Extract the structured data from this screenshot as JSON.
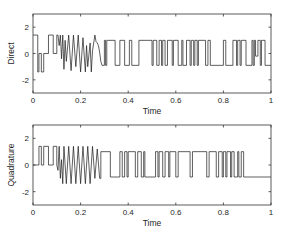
{
  "figure": {
    "width": 284,
    "height": 236,
    "line_color": "#1a1a1a",
    "axis_color": "#333333",
    "background": "#ffffff"
  },
  "chart_data": [
    {
      "type": "line",
      "id": "direct",
      "title": "",
      "xlabel": "Time",
      "ylabel": "Direct",
      "xlim": [
        0,
        1
      ],
      "ylim": [
        -3,
        3
      ],
      "xticks": [
        0,
        0.2,
        0.4,
        0.6,
        0.8,
        1
      ],
      "xtick_labels": [
        "0",
        "0.2",
        "0.4",
        "0.6",
        "0.8",
        "1"
      ],
      "yticks": [
        2,
        0,
        -2
      ],
      "ytick_labels": [
        "2",
        "0",
        "-2"
      ],
      "grid": false,
      "legend": null,
      "box": {
        "left": 33,
        "right": 271,
        "top": 14,
        "bottom": 93
      },
      "series": [
        {
          "name": "Direct",
          "x": [
            0,
            0.02,
            0.02,
            0.025,
            0.025,
            0.035,
            0.035,
            0.045,
            0.045,
            0.065,
            0.065,
            0.085,
            0.085,
            0.1,
            0.1,
            0.105,
            0.11,
            0.115,
            0.12,
            0.125,
            0.13,
            0.135,
            0.14,
            0.15,
            0.16,
            0.17,
            0.18,
            0.19,
            0.2,
            0.21,
            0.22,
            0.225,
            0.23,
            0.24,
            0.245,
            0.25,
            0.26,
            0.265,
            0.27,
            0.275,
            0.28,
            0.285,
            0.29,
            0.3,
            0.3,
            0.305,
            0.305,
            0.31,
            0.31,
            0.345,
            0.345,
            0.365,
            0.365,
            0.385,
            0.385,
            0.405,
            0.405,
            0.415,
            0.415,
            0.445,
            0.445,
            0.5,
            0.5,
            0.505,
            0.505,
            0.52,
            0.52,
            0.53,
            0.53,
            0.54,
            0.54,
            0.545,
            0.545,
            0.555,
            0.555,
            0.565,
            0.565,
            0.585,
            0.585,
            0.59,
            0.59,
            0.61,
            0.61,
            0.625,
            0.625,
            0.63,
            0.63,
            0.645,
            0.645,
            0.66,
            0.66,
            0.665,
            0.665,
            0.675,
            0.675,
            0.68,
            0.68,
            0.69,
            0.69,
            0.695,
            0.695,
            0.725,
            0.725,
            0.735,
            0.735,
            0.745,
            0.745,
            0.8,
            0.8,
            0.81,
            0.81,
            0.84,
            0.84,
            0.855,
            0.855,
            0.86,
            0.86,
            0.87,
            0.87,
            0.875,
            0.875,
            0.895,
            0.895,
            0.92,
            0.92,
            0.925,
            0.925,
            0.93,
            0.93,
            0.935,
            0.935,
            0.945,
            0.945,
            0.955,
            0.955,
            0.96,
            0.96,
            0.975,
            0.975,
            1
          ],
          "y": [
            1.4,
            1.4,
            -1.4,
            -1.4,
            0,
            0,
            -1.4,
            -1.4,
            0,
            0,
            1.4,
            1.4,
            0,
            0,
            1.4,
            1.4,
            0.6,
            1.4,
            -0.4,
            1.4,
            -1.2,
            1.0,
            -0.6,
            1.4,
            -1.3,
            1.4,
            -1.0,
            1.4,
            -1.4,
            1.2,
            -1.4,
            0.6,
            -1.0,
            0.8,
            -1.4,
            0.2,
            1.4,
            0.9,
            0.8,
            0.6,
            0.1,
            -0.6,
            -0.9,
            -0.9,
            1.0,
            1.0,
            -0.9,
            -0.9,
            1.0,
            1.0,
            -0.9,
            -0.9,
            1.0,
            1.0,
            -0.9,
            -0.9,
            1.0,
            1.0,
            -0.9,
            -0.9,
            1.0,
            1.0,
            -0.9,
            -0.9,
            1.0,
            1.0,
            -0.9,
            -0.9,
            1.0,
            1.0,
            -0.9,
            -0.9,
            1.0,
            1.0,
            -0.9,
            -0.9,
            1.0,
            1.0,
            -0.9,
            -0.9,
            1.0,
            1.0,
            -0.9,
            -0.9,
            1.0,
            1.0,
            -0.9,
            -0.9,
            1.0,
            1.0,
            -0.9,
            -0.9,
            1.0,
            1.0,
            -0.9,
            -0.9,
            1.0,
            1.0,
            -0.9,
            -0.9,
            1.0,
            1.0,
            -0.9,
            -0.9,
            1.0,
            1.0,
            -0.9,
            -0.9,
            1.0,
            1.0,
            -0.9,
            -0.9,
            1.0,
            1.0,
            -0.9,
            -0.9,
            1.0,
            1.0,
            -0.9,
            -0.9,
            1.0,
            1.0,
            -0.9,
            -0.9,
            1.0,
            1.0,
            -0.9,
            -0.9,
            1.0,
            1.0,
            -0.2,
            -0.2,
            1.0,
            1.0,
            -0.9,
            -0.9,
            1.0,
            1.0,
            -0.9,
            -0.9,
            -0.9
          ]
        }
      ]
    },
    {
      "type": "line",
      "id": "quadrature",
      "title": "",
      "xlabel": "Time",
      "ylabel": "Quadrature",
      "xlim": [
        0,
        1
      ],
      "ylim": [
        -3,
        3
      ],
      "xticks": [
        0,
        0.2,
        0.4,
        0.6,
        0.8,
        1
      ],
      "xtick_labels": [
        "0",
        "0.2",
        "0.4",
        "0.6",
        "0.8",
        "1"
      ],
      "yticks": [
        2,
        0,
        -2
      ],
      "ytick_labels": [
        "2",
        "0",
        "-2"
      ],
      "grid": false,
      "legend": null,
      "box": {
        "left": 33,
        "right": 271,
        "top": 125,
        "bottom": 205
      },
      "series": [
        {
          "name": "Quadrature",
          "x": [
            0,
            0.02,
            0.02,
            0.025,
            0.025,
            0.035,
            0.035,
            0.045,
            0.045,
            0.065,
            0.065,
            0.085,
            0.085,
            0.1,
            0.1,
            0.105,
            0.11,
            0.115,
            0.12,
            0.125,
            0.13,
            0.14,
            0.15,
            0.16,
            0.17,
            0.18,
            0.19,
            0.2,
            0.21,
            0.22,
            0.23,
            0.24,
            0.25,
            0.26,
            0.27,
            0.28,
            0.285,
            0.285,
            0.325,
            0.325,
            0.365,
            0.365,
            0.375,
            0.375,
            0.385,
            0.385,
            0.395,
            0.395,
            0.4,
            0.4,
            0.43,
            0.43,
            0.44,
            0.44,
            0.455,
            0.455,
            0.465,
            0.465,
            0.47,
            0.47,
            0.515,
            0.515,
            0.525,
            0.525,
            0.53,
            0.53,
            0.545,
            0.545,
            0.555,
            0.555,
            0.57,
            0.57,
            0.575,
            0.575,
            0.6,
            0.6,
            0.61,
            0.61,
            0.66,
            0.66,
            0.67,
            0.67,
            0.73,
            0.73,
            0.74,
            0.74,
            0.77,
            0.77,
            0.78,
            0.78,
            0.795,
            0.795,
            0.8,
            0.8,
            0.81,
            0.81,
            0.815,
            0.815,
            0.83,
            0.83,
            0.835,
            0.835,
            0.845,
            0.845,
            0.86,
            0.86,
            0.865,
            0.865,
            0.875,
            0.875,
            0.885,
            0.885,
            1
          ],
          "y": [
            0,
            0,
            0,
            0,
            1.4,
            1.4,
            0,
            0,
            1.4,
            1.4,
            0,
            0,
            1.4,
            1.4,
            0,
            -0.4,
            1.4,
            -1.0,
            0.4,
            -1.4,
            1.4,
            -1.4,
            1.4,
            -1.4,
            1.4,
            -1.4,
            1.4,
            -1.4,
            1.4,
            -1.4,
            1.4,
            -1.4,
            1.4,
            -1.0,
            1.2,
            -1.0,
            -1.0,
            1.0,
            1.0,
            -0.9,
            -0.9,
            1.0,
            1.0,
            -0.9,
            -0.9,
            1.0,
            1.0,
            -0.9,
            -0.9,
            1.0,
            1.0,
            -0.9,
            -0.9,
            1.0,
            1.0,
            -0.9,
            -0.9,
            1.0,
            1.0,
            -0.9,
            -0.9,
            1.0,
            1.0,
            -0.9,
            -0.9,
            1.0,
            1.0,
            -0.9,
            -0.9,
            1.0,
            1.0,
            -0.9,
            -0.9,
            1.0,
            1.0,
            -0.9,
            -0.9,
            1.0,
            1.0,
            -0.9,
            -0.9,
            1.0,
            1.0,
            -0.9,
            -0.9,
            1.0,
            1.0,
            -0.9,
            -0.9,
            1.0,
            1.0,
            -0.9,
            -0.9,
            1.0,
            1.0,
            -0.9,
            -0.9,
            1.0,
            1.0,
            -0.9,
            -0.9,
            1.0,
            1.0,
            -0.9,
            -0.9,
            1.0,
            1.0,
            -0.9,
            -0.9,
            1.0,
            1.0,
            -0.9,
            -0.9,
            -0.9
          ]
        }
      ]
    }
  ]
}
